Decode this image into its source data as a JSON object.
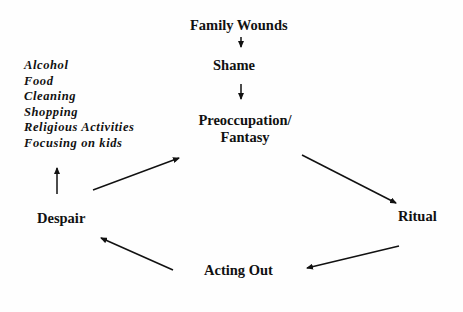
{
  "diagram": {
    "nodes": {
      "family_wounds": "Family Wounds",
      "shame": "Shame",
      "preoccupation_line1": "Preoccupation/",
      "preoccupation_line2": "Fantasy",
      "ritual": "Ritual",
      "acting_out": "Acting Out",
      "despair": "Despair"
    },
    "coping_list": [
      "Alcohol",
      "Food",
      "Cleaning",
      "Shopping",
      "Religious Activities",
      "Focusing on kids"
    ],
    "edges": [
      {
        "from": "Family Wounds",
        "to": "Shame"
      },
      {
        "from": "Shame",
        "to": "Preoccupation/Fantasy"
      },
      {
        "from": "Preoccupation/Fantasy",
        "to": "Ritual"
      },
      {
        "from": "Ritual",
        "to": "Acting Out"
      },
      {
        "from": "Acting Out",
        "to": "Despair"
      },
      {
        "from": "Despair",
        "to": "Preoccupation/Fantasy"
      },
      {
        "from": "Despair",
        "to": "coping list"
      }
    ],
    "colors": {
      "ink": "#111111",
      "background": "#fefefe"
    }
  }
}
